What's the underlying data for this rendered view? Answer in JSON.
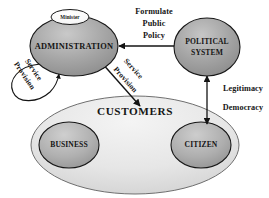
{
  "diagram": {
    "background_color": "#ffffff",
    "nodes": {
      "administration": {
        "label": "ADMINISTRATION",
        "shape": "ellipse",
        "fill": "#9a9a9a"
      },
      "minister": {
        "label": "Minister",
        "shape": "ellipse",
        "fill": "#fdfdfd"
      },
      "political_system": {
        "label_line1": "POLITICAL",
        "label_line2": "SYSTEM",
        "shape": "ellipse",
        "fill": "#9a9a9a"
      },
      "customers": {
        "label": "CUSTOMERS",
        "shape": "ellipse",
        "fill": "#e8e8e8"
      },
      "business": {
        "label": "BUSINESS",
        "shape": "ellipse",
        "fill": "#a8a8a8"
      },
      "citizen": {
        "label": "CITIZEN",
        "shape": "ellipse",
        "fill": "#a8a8a8"
      }
    },
    "edges": {
      "formulate_policy": {
        "label_line1": "Formulate",
        "label_line2": "Public",
        "label_line3": "Policy",
        "from": "administration",
        "to": "political_system",
        "arrow": "double"
      },
      "service_provision_loop": {
        "label_line1": "Service",
        "label_line2": "Provision",
        "from": "administration",
        "to": "administration",
        "arrow": "single"
      },
      "service_provision_customers": {
        "label_line1": "Service",
        "label_line2": "Provision",
        "from": "administration",
        "to": "customers",
        "arrow": "double"
      },
      "legitimacy_democracy": {
        "label_line1": "Legitimacy",
        "label_line2": "Democracy",
        "from": "political_system",
        "to": "citizen",
        "arrow": "double"
      }
    },
    "colors": {
      "stroke": "#141414",
      "node_fill_dark": "#9a9a9a",
      "node_fill_light": "#e8e8e8",
      "text": "#151515"
    }
  }
}
